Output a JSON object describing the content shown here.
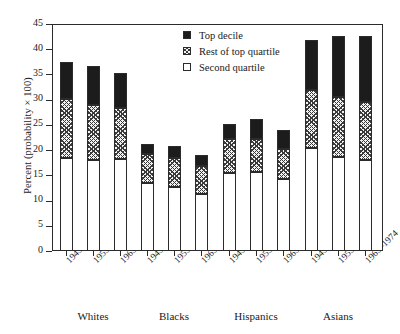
{
  "chart_data": {
    "type": "bar",
    "subtype": "stacked",
    "title": "",
    "xlabel": "",
    "ylabel": "Percent (probability × 100)",
    "ylim": [
      0,
      45
    ],
    "yticks": [
      0,
      5,
      10,
      15,
      20,
      25,
      30,
      35,
      40,
      45
    ],
    "ytick_labels": [
      "0",
      "5",
      "10",
      "15",
      "20",
      "25",
      "30",
      "35",
      "40",
      "45"
    ],
    "grid": false,
    "legend_position": "top-center",
    "groups": [
      "Whites",
      "Blacks",
      "Hispanics",
      "Asians"
    ],
    "categories": [
      "1945–1954",
      "1955–1964",
      "1965–1974",
      "1945–1954",
      "1955–1964",
      "1965–1974",
      "1945–1954",
      "1955–1964",
      "1965–1974",
      "1945–1954",
      "1955–1964",
      "1965–1974"
    ],
    "series": [
      {
        "name": "Second quartile",
        "color": "#ffffff",
        "pattern": "solid",
        "values": [
          18.5,
          18.0,
          18.2,
          13.4,
          12.7,
          11.3,
          15.4,
          15.6,
          14.3,
          20.4,
          18.6,
          18.0
        ]
      },
      {
        "name": "Rest of top quartile",
        "color": "#f2f2f2",
        "pattern": "crosshatch",
        "values": [
          11.6,
          11.0,
          10.2,
          5.8,
          5.8,
          5.6,
          6.8,
          6.7,
          6.0,
          11.6,
          12.0,
          11.5
        ]
      },
      {
        "name": "Top decile",
        "color": "#1c1c1c",
        "pattern": "solid",
        "values": [
          7.3,
          7.7,
          6.9,
          2.1,
          2.4,
          2.1,
          3.0,
          3.9,
          3.6,
          9.8,
          12.0,
          13.1
        ]
      }
    ],
    "totals": [
      37.4,
      36.7,
      35.3,
      21.3,
      20.9,
      19.0,
      25.2,
      26.2,
      23.9,
      41.8,
      42.6,
      42.6
    ],
    "cumulative_tops": {
      "second_quartile": [
        18.5,
        18.0,
        18.2,
        13.4,
        12.7,
        11.3,
        15.4,
        15.6,
        14.3,
        20.4,
        18.6,
        18.0
      ],
      "rest_of_top_quartile": [
        30.1,
        29.0,
        28.4,
        19.2,
        18.5,
        16.9,
        22.2,
        22.3,
        20.3,
        32.0,
        30.6,
        29.5
      ],
      "top_decile": [
        37.4,
        36.7,
        35.3,
        21.3,
        20.9,
        19.0,
        25.2,
        26.2,
        23.9,
        41.8,
        42.6,
        42.6
      ]
    }
  },
  "legend": {
    "items": [
      {
        "label": "Top decile",
        "swatch": "filled-black-square"
      },
      {
        "label": "Rest of top quartile",
        "swatch": "crosshatched-square"
      },
      {
        "label": "Second quartile",
        "swatch": "empty-white-square"
      }
    ]
  }
}
